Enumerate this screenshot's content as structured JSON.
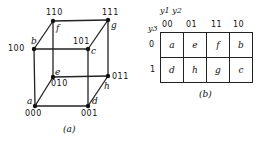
{
  "figure_a": {
    "caption": "(a)",
    "vertices": [
      {
        "name": "a",
        "code": "000"
      },
      {
        "name": "b",
        "code": "100"
      },
      {
        "name": "c",
        "code": "101"
      },
      {
        "name": "d",
        "code": "001"
      },
      {
        "name": "e",
        "code": "010"
      },
      {
        "name": "f",
        "code": "110"
      },
      {
        "name": "g",
        "code": "111"
      },
      {
        "name": "h",
        "code": "011"
      }
    ]
  },
  "figure_b": {
    "caption": "(b)",
    "col_var_label": "y1 y2",
    "row_var_label": "y3",
    "col_headers": [
      "00",
      "01",
      "11",
      "10"
    ],
    "row_headers": [
      "0",
      "1"
    ],
    "cells": [
      [
        "a",
        "e",
        "f",
        "b"
      ],
      [
        "d",
        "h",
        "g",
        "c"
      ]
    ]
  },
  "colors": {
    "ink": "#111111",
    "background": "#ffffff"
  }
}
